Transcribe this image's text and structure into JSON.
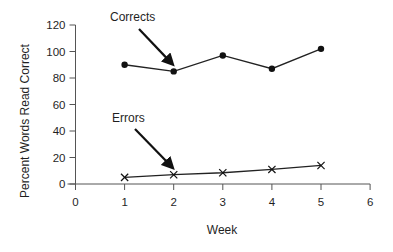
{
  "chart_data": {
    "type": "line",
    "title": "",
    "xlabel": "Week",
    "ylabel": "Percent Words Read Correct",
    "xlim": [
      0,
      6
    ],
    "ylim": [
      0,
      120
    ],
    "x_ticks": [
      0,
      1,
      2,
      3,
      4,
      5,
      6
    ],
    "y_ticks": [
      0,
      20,
      40,
      60,
      80,
      100,
      120
    ],
    "grid": false,
    "legend": null,
    "x": [
      1,
      2,
      3,
      4,
      5
    ],
    "series": [
      {
        "name": "Corrects",
        "marker": "circle",
        "values": [
          90,
          85,
          97,
          87,
          102
        ]
      },
      {
        "name": "Errors",
        "marker": "x",
        "values": [
          5,
          7,
          8.5,
          11,
          14
        ]
      }
    ],
    "annotations": [
      {
        "text": "Corrects",
        "points_to": {
          "x": 2,
          "y": 85
        }
      },
      {
        "text": "Errors",
        "points_to": {
          "x": 2,
          "y": 7
        }
      }
    ]
  }
}
